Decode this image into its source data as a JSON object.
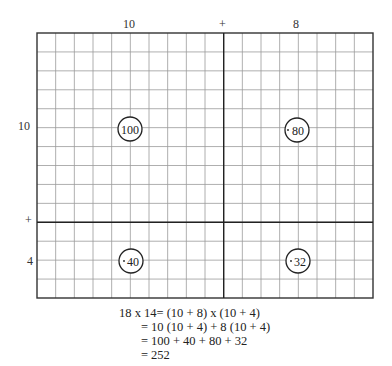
{
  "diagram": {
    "top_labels": {
      "left": "10",
      "plus": "+",
      "right": "8"
    },
    "side_labels": {
      "top": "10",
      "plus": "+",
      "bottom": "4"
    },
    "grid": {
      "cols_left": 10,
      "cols_right": 8,
      "rows_top": 10,
      "rows_bottom": 4,
      "line_color": "#9a9a9a",
      "border_color": "#333333"
    },
    "regions": [
      {
        "name": "top-left",
        "value": "100"
      },
      {
        "name": "top-right",
        "value": "80"
      },
      {
        "name": "bottom-left",
        "value": "40"
      },
      {
        "name": "bottom-right",
        "value": "32"
      }
    ]
  },
  "equation": {
    "lines": [
      "18 x 14= (10 + 8) x (10 + 4)",
      "       = 10 (10 + 4) + 8 (10 + 4)",
      "       = 100 + 40 + 80 + 32",
      "       = 252"
    ]
  }
}
